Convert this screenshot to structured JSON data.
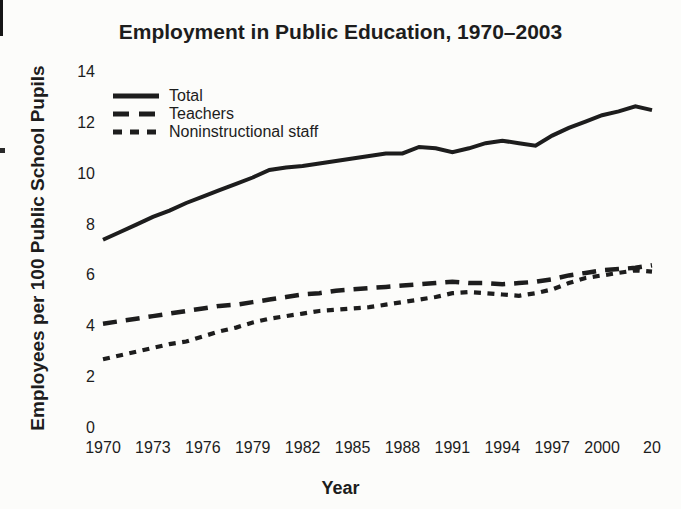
{
  "chart_data": {
    "type": "line",
    "title": "Employment in Public Education, 1970–2003",
    "xlabel": "Year",
    "ylabel": "Employees per 100 Public School Pupils",
    "ink_color": "#1d1d1d",
    "grid": false,
    "axes_drawn": false,
    "legend_position": "top-left",
    "ylim": [
      0,
      14
    ],
    "yticks": [
      0,
      2,
      4,
      6,
      8,
      10,
      12,
      14
    ],
    "xticks": {
      "years": [
        1970,
        1973,
        1976,
        1979,
        1982,
        1985,
        1988,
        1991,
        1994,
        1997,
        2000,
        2003
      ],
      "labels": [
        "1970",
        "1973",
        "1976",
        "1979",
        "1982",
        "1985",
        "1988",
        "1991",
        "1994",
        "1997",
        "2000",
        "20"
      ]
    },
    "x": [
      1970,
      1971,
      1972,
      1973,
      1974,
      1975,
      1976,
      1977,
      1978,
      1979,
      1980,
      1981,
      1982,
      1983,
      1984,
      1985,
      1986,
      1987,
      1988,
      1989,
      1990,
      1991,
      1992,
      1993,
      1994,
      1995,
      1996,
      1997,
      1998,
      1999,
      2000,
      2001,
      2002,
      2003
    ],
    "series": [
      {
        "name": "Total",
        "line_style": "solid",
        "values": [
          7.4,
          7.7,
          8.0,
          8.3,
          8.55,
          8.85,
          9.1,
          9.35,
          9.6,
          9.85,
          10.15,
          10.25,
          10.3,
          10.4,
          10.5,
          10.6,
          10.7,
          10.8,
          10.8,
          11.05,
          11.0,
          10.85,
          11.0,
          11.2,
          11.3,
          11.2,
          11.1,
          11.5,
          11.8,
          12.05,
          12.3,
          12.45,
          12.65,
          12.5
        ]
      },
      {
        "name": "Teachers",
        "line_style": "long-dash",
        "values": [
          4.1,
          4.2,
          4.3,
          4.4,
          4.5,
          4.6,
          4.7,
          4.8,
          4.85,
          4.95,
          5.05,
          5.15,
          5.25,
          5.3,
          5.4,
          5.45,
          5.5,
          5.55,
          5.6,
          5.65,
          5.7,
          5.75,
          5.7,
          5.7,
          5.65,
          5.7,
          5.75,
          5.85,
          6.0,
          6.1,
          6.2,
          6.25,
          6.3,
          6.4
        ]
      },
      {
        "name": "Noninstructional staff",
        "line_style": "short-dash",
        "values": [
          2.7,
          2.85,
          3.0,
          3.15,
          3.3,
          3.4,
          3.6,
          3.8,
          3.95,
          4.15,
          4.3,
          4.4,
          4.5,
          4.6,
          4.65,
          4.7,
          4.75,
          4.85,
          4.95,
          5.05,
          5.15,
          5.3,
          5.35,
          5.3,
          5.25,
          5.2,
          5.3,
          5.45,
          5.7,
          5.9,
          6.0,
          6.1,
          6.2,
          6.15
        ]
      }
    ]
  }
}
